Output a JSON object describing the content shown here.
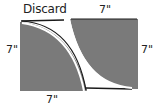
{
  "diagram": {
    "labels": {
      "discard": "Discard",
      "top": "7\"",
      "left": "7\"",
      "right": "7\"",
      "bottom": "7\""
    },
    "colors": {
      "panel_fill": "#7a7a7a",
      "panel_edge": "#1a1a1a",
      "cut_line": "#ffffff",
      "background": "#ffffff",
      "text": "#222222"
    },
    "panels": [
      {
        "name": "left-panel",
        "width_in": 7,
        "height_in": 7,
        "curve": "concave top-right corner removed"
      },
      {
        "name": "right-panel",
        "width_in": 7,
        "height_in": 7,
        "curve": "concave bottom-left corner removed"
      }
    ]
  }
}
